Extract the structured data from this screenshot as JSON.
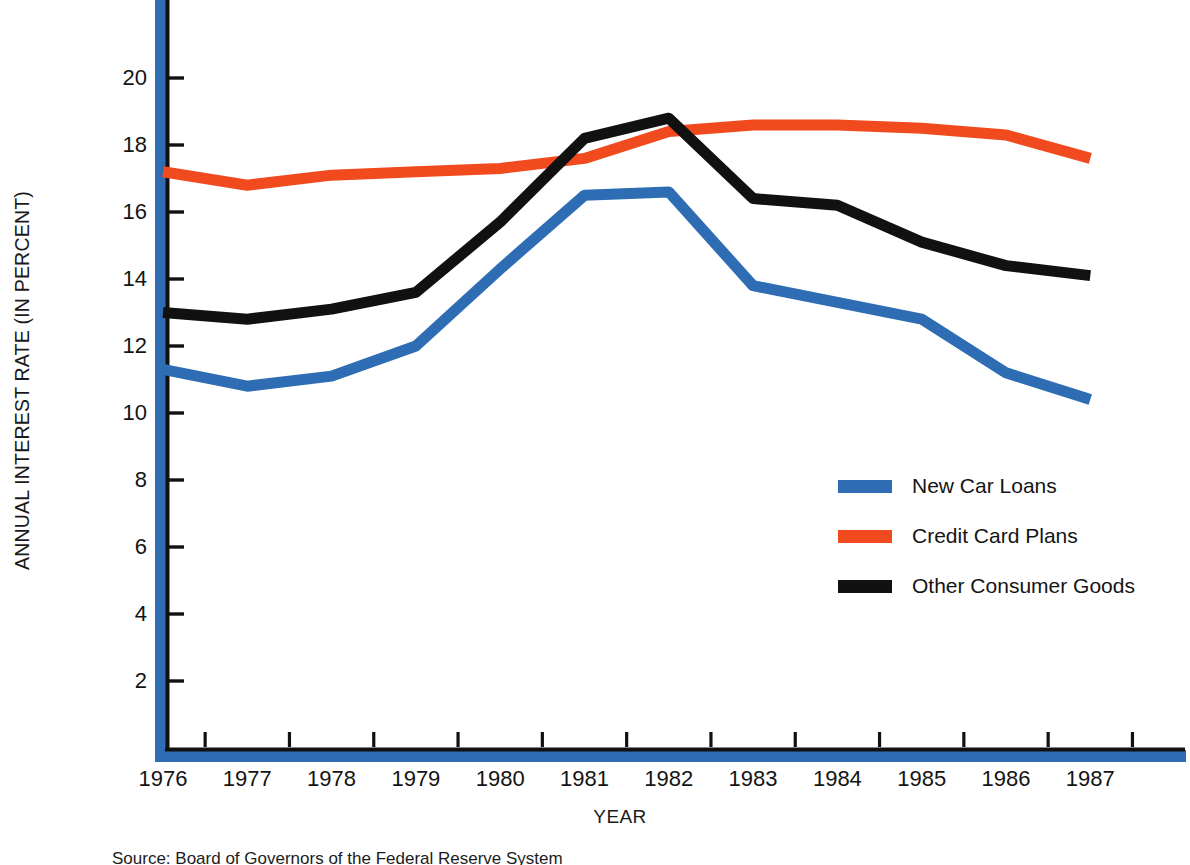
{
  "chart_data": {
    "type": "line",
    "title": "",
    "xlabel": "YEAR",
    "ylabel": "ANNUAL INTEREST RATE (IN PERCENT)",
    "categories": [
      1976,
      1977,
      1978,
      1979,
      1980,
      1981,
      1982,
      1983,
      1984,
      1985,
      1986,
      1987
    ],
    "xlim": [
      1976,
      1988.8
    ],
    "ylim": [
      0,
      21.4
    ],
    "yticks": [
      2,
      4,
      6,
      8,
      10,
      12,
      14,
      16,
      18,
      20
    ],
    "ytick_labels": [
      "2",
      "4",
      "6",
      "8",
      "10",
      "12",
      "14",
      "16",
      "18",
      "20"
    ],
    "xtick_labels": [
      "1976",
      "1977",
      "1978",
      "1979",
      "1980",
      "1981",
      "1982",
      "1983",
      "1984",
      "1985",
      "1986",
      "1987"
    ],
    "grid": false,
    "legend_position": "center-right",
    "series": [
      {
        "name": "New Car Loans",
        "color": "#2E6DB4",
        "values": [
          11.3,
          10.8,
          11.1,
          12.0,
          14.3,
          16.5,
          16.6,
          13.8,
          13.3,
          12.8,
          11.2,
          10.4
        ]
      },
      {
        "name": "Credit Card Plans",
        "color": "#F04A1E",
        "values": [
          17.2,
          16.8,
          17.1,
          17.2,
          17.3,
          17.6,
          18.4,
          18.6,
          18.6,
          18.5,
          18.3,
          17.6
        ]
      },
      {
        "name": "Other Consumer Goods",
        "color": "#111111",
        "values": [
          13.0,
          12.8,
          13.1,
          13.6,
          15.7,
          18.2,
          18.8,
          16.4,
          16.2,
          15.1,
          14.4,
          14.1
        ]
      }
    ]
  },
  "legend": {
    "items": [
      {
        "label": "New Car Loans",
        "color": "#2E6DB4"
      },
      {
        "label": "Credit Card Plans",
        "color": "#F04A1E"
      },
      {
        "label": "Other Consumer Goods",
        "color": "#111111"
      }
    ]
  },
  "axes": {
    "y_title": "ANNUAL INTEREST RATE (IN PERCENT)",
    "x_title": "YEAR",
    "axis_accent_color": "#2E6DB4",
    "axis_line_color": "#111111"
  },
  "footer": {
    "source_note": "Source:  Board of Governors of the Federal Reserve System"
  }
}
